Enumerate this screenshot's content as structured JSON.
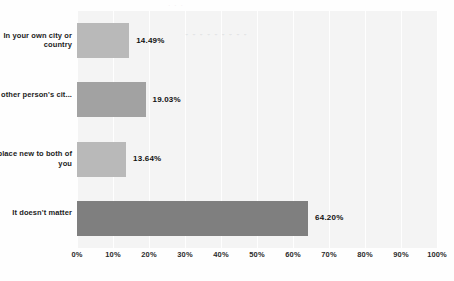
{
  "chart_data": {
    "type": "bar",
    "orientation": "horizontal",
    "title": "",
    "xlabel": "",
    "ylabel": "",
    "categories": [
      "In your own city or country",
      "In the other person's cit...",
      "In a place new to both of you",
      "It doesn't matter"
    ],
    "values": [
      14.49,
      19.03,
      13.64,
      64.2
    ],
    "value_labels": [
      "14.49%",
      "19.03%",
      "13.64%",
      "64.20%"
    ],
    "bar_colors": [
      "#b9b9b9",
      "#a2a2a2",
      "#b9b9b9",
      "#7f7f7f"
    ],
    "xlim": [
      0,
      100
    ],
    "xtick_labels": [
      "0%",
      "10%",
      "20%",
      "30%",
      "40%",
      "50%",
      "60%",
      "70%",
      "80%",
      "90%",
      "100%"
    ],
    "xtick_values": [
      0,
      10,
      20,
      30,
      40,
      50,
      60,
      70,
      80,
      90,
      100
    ],
    "grid": true,
    "legend": false,
    "plot_background": "#f4f4f4",
    "figure_background": "#fefefe"
  },
  "artifacts": {
    "ghost_text": "- -  -    - -      -  - -   -",
    "ghost_text_top": "-   -  -"
  }
}
